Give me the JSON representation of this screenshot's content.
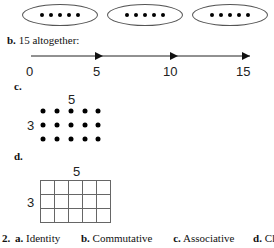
{
  "part_a": {
    "groups": 3,
    "dots_per_group": 5
  },
  "part_b": {
    "label": "b.",
    "text": "15 altogether:",
    "ticks": [
      "0",
      "5",
      "10",
      "15"
    ]
  },
  "part_c": {
    "label": "c.",
    "columns_label": "5",
    "rows_label": "3",
    "rows": 3,
    "cols": 5
  },
  "part_d": {
    "label": "d.",
    "columns_label": "5",
    "rows_label": "3",
    "rows": 3,
    "cols": 5
  },
  "question2": {
    "number": "2.",
    "answers": [
      {
        "label": "a.",
        "text": "Identity"
      },
      {
        "label": "b.",
        "text": "Commutative"
      },
      {
        "label": "c.",
        "text": "Associative"
      },
      {
        "label": "d.",
        "text": "Clo"
      }
    ]
  }
}
